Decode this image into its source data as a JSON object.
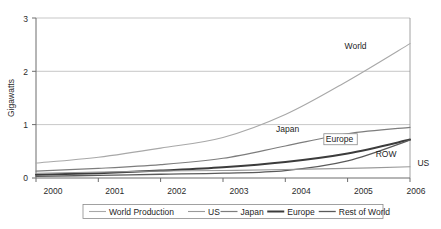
{
  "chart_data": {
    "type": "line",
    "title": "",
    "subtitle": "",
    "xlabel": "",
    "ylabel": "Gigawatts",
    "x": [
      2000,
      2001,
      2002,
      2003,
      2004,
      2005,
      2006
    ],
    "categories": [
      "2000",
      "2001",
      "2002",
      "2003",
      "2004",
      "2005",
      "2006"
    ],
    "xtick_labels": [
      "2000",
      "2001",
      "2002",
      "2003",
      "2004",
      "2005",
      "2006"
    ],
    "ytick_labels": [
      "0",
      "1",
      "2",
      "3"
    ],
    "ytick_values": [
      0,
      1,
      2,
      3
    ],
    "ylim": [
      0,
      3
    ],
    "xlim": [
      2000,
      2006
    ],
    "grid": "horizontal",
    "legend_position": "bottom",
    "series": [
      {
        "name": "World Production",
        "short_label": "World",
        "color": "#a8a8a8",
        "width": 1.1,
        "values": [
          0.28,
          0.39,
          0.56,
          0.76,
          1.19,
          1.82,
          2.52
        ]
      },
      {
        "name": "Japan",
        "short_label": "Japan",
        "color": "#7d7d7d",
        "width": 1.2,
        "values": [
          0.13,
          0.18,
          0.25,
          0.37,
          0.6,
          0.83,
          0.95
        ]
      },
      {
        "name": "Europe",
        "short_label": "Europe",
        "color": "#3c3c3c",
        "width": 2.0,
        "values": [
          0.06,
          0.09,
          0.14,
          0.2,
          0.3,
          0.46,
          0.72
        ]
      },
      {
        "name": "Rest of World",
        "short_label": "ROW",
        "color": "#5a5a5a",
        "width": 1.3,
        "values": [
          0.03,
          0.05,
          0.07,
          0.09,
          0.14,
          0.32,
          0.71
        ]
      },
      {
        "name": "US",
        "short_label": "US",
        "color": "#9a9a9a",
        "width": 1.1,
        "values": [
          0.09,
          0.11,
          0.13,
          0.14,
          0.16,
          0.18,
          0.21
        ]
      }
    ],
    "annotations": [
      {
        "text": "World",
        "x": 2004.95,
        "y": 2.42,
        "boxed": false
      },
      {
        "text": "Japan",
        "x": 2003.85,
        "y": 0.86,
        "boxed": false
      },
      {
        "text": "Europe",
        "x": 2004.65,
        "y": 0.68,
        "boxed": true
      },
      {
        "text": "ROW",
        "x": 2005.45,
        "y": 0.4,
        "boxed": false
      },
      {
        "text": "US",
        "x": 2006.12,
        "y": 0.23,
        "boxed": false
      }
    ]
  },
  "legend": {
    "entries": [
      {
        "label": "World Production"
      },
      {
        "label": "US"
      },
      {
        "label": "Japan"
      },
      {
        "label": "Europe"
      },
      {
        "label": "Rest of World"
      }
    ]
  },
  "axes": {
    "y_title": "Gigawatts"
  }
}
